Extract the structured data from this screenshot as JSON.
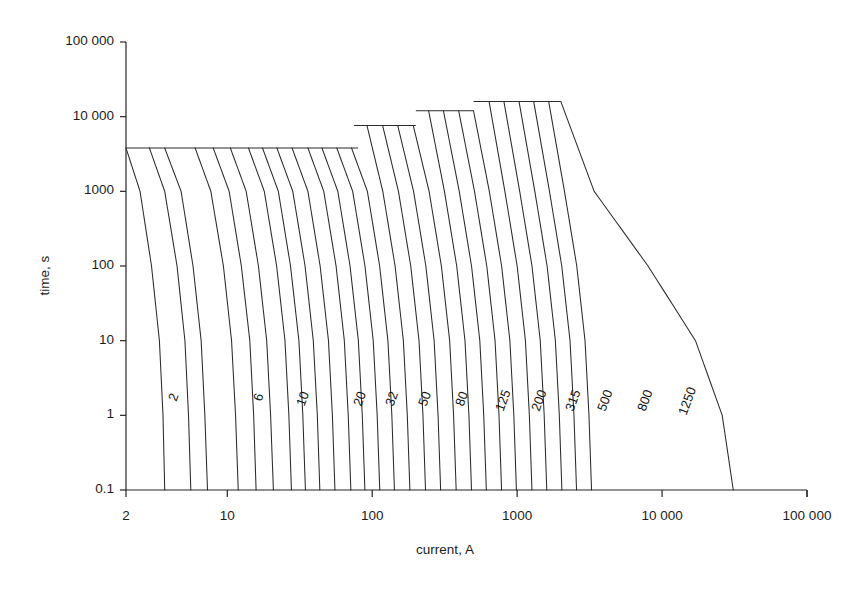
{
  "page": {
    "cut_off_caption": "",
    "background": "#ffffff",
    "ink": "#1a1a1a"
  },
  "chart_data": {
    "type": "line",
    "title": "",
    "xlabel": "current, A",
    "ylabel": "time, s",
    "xscale": "log",
    "yscale": "log",
    "xlim": [
      2,
      100000
    ],
    "ylim": [
      0.1,
      100000
    ],
    "grid": false,
    "legend": "none",
    "xticks": [
      2,
      10,
      100,
      1000,
      10000,
      100000
    ],
    "xtick_labels": [
      "2",
      "10",
      "100",
      "1000",
      "10 000",
      "100 000"
    ],
    "yticks": [
      0.1,
      1,
      10,
      100,
      1000,
      10000,
      100000
    ],
    "ytick_labels": [
      "0.1",
      "1",
      "10",
      "100",
      "1000",
      "10 000",
      "100 000"
    ],
    "labeled_series": [
      "2",
      "6",
      "10",
      "20",
      "32",
      "50",
      "80",
      "125",
      "200",
      "315",
      "500",
      "800",
      "1250"
    ],
    "plateaus": [
      {
        "time_s": 3800,
        "current_from": 2,
        "current_to": 80
      },
      {
        "time_s": 7600,
        "current_from": 75,
        "current_to": 200
      },
      {
        "time_s": 12000,
        "current_from": 200,
        "current_to": 500
      },
      {
        "time_s": 16000,
        "current_from": 500,
        "current_to": 2000
      }
    ],
    "series": [
      {
        "name": "2",
        "label": "2",
        "plateau_time": 3800,
        "x": [
          2,
          2.5,
          3.0,
          3.4,
          3.6,
          3.7
        ],
        "y": [
          3800,
          1000,
          100,
          10,
          1,
          0.1
        ]
      },
      {
        "name": "3",
        "label": "",
        "plateau_time": 3800,
        "x": [
          2.9,
          3.7,
          4.5,
          5.1,
          5.4,
          5.6
        ],
        "y": [
          3800,
          1000,
          100,
          10,
          1,
          0.1
        ]
      },
      {
        "name": "4",
        "label": "",
        "plateau_time": 3800,
        "x": [
          3.7,
          4.8,
          5.8,
          6.6,
          7.0,
          7.3
        ],
        "y": [
          3800,
          1000,
          100,
          10,
          1,
          0.1
        ]
      },
      {
        "name": "6",
        "label": "6",
        "plateau_time": 3800,
        "x": [
          6.0,
          7.7,
          9.4,
          10.7,
          11.4,
          11.9
        ],
        "y": [
          3800,
          1000,
          100,
          10,
          1,
          0.1
        ]
      },
      {
        "name": "8",
        "label": "",
        "plateau_time": 3800,
        "x": [
          8.0,
          10.3,
          12.5,
          14.3,
          15.2,
          15.8
        ],
        "y": [
          3800,
          1000,
          100,
          10,
          1,
          0.1
        ]
      },
      {
        "name": "10",
        "label": "10",
        "plateau_time": 3800,
        "x": [
          10.5,
          13.5,
          16.4,
          18.7,
          19.9,
          20.8
        ],
        "y": [
          3800,
          1000,
          100,
          10,
          1,
          0.1
        ]
      },
      {
        "name": "13",
        "label": "",
        "plateau_time": 3800,
        "x": [
          14.0,
          18.0,
          21.9,
          25.0,
          26.6,
          27.7
        ],
        "y": [
          3800,
          1000,
          100,
          10,
          1,
          0.1
        ]
      },
      {
        "name": "16",
        "label": "",
        "plateau_time": 3800,
        "x": [
          17.5,
          22.5,
          27.3,
          31.2,
          33.2,
          34.6
        ],
        "y": [
          3800,
          1000,
          100,
          10,
          1,
          0.1
        ]
      },
      {
        "name": "20",
        "label": "20",
        "plateau_time": 3800,
        "x": [
          22.0,
          28.3,
          34.4,
          39.2,
          41.8,
          43.5
        ],
        "y": [
          3800,
          1000,
          100,
          10,
          1,
          0.1
        ]
      },
      {
        "name": "25",
        "label": "",
        "plateau_time": 3800,
        "x": [
          28.0,
          36.0,
          43.7,
          49.9,
          53.1,
          55.3
        ],
        "y": [
          3800,
          1000,
          100,
          10,
          1,
          0.1
        ]
      },
      {
        "name": "32",
        "label": "32",
        "plateau_time": 3800,
        "x": [
          36.0,
          46.3,
          56.3,
          64.2,
          68.3,
          71.2
        ],
        "y": [
          3800,
          1000,
          100,
          10,
          1,
          0.1
        ]
      },
      {
        "name": "40",
        "label": "",
        "plateau_time": 3800,
        "x": [
          45.0,
          57.9,
          70.3,
          80.2,
          85.4,
          89.0
        ],
        "y": [
          3800,
          1000,
          100,
          10,
          1,
          0.1
        ]
      },
      {
        "name": "50",
        "label": "50",
        "plateau_time": 3800,
        "x": [
          57.0,
          73.3,
          89.1,
          101.6,
          108.2,
          112.7
        ],
        "y": [
          3800,
          1000,
          100,
          10,
          1,
          0.1
        ]
      },
      {
        "name": "63",
        "label": "",
        "plateau_time": 3800,
        "x": [
          72.0,
          92.6,
          112.5,
          128.3,
          136.6,
          142.3
        ],
        "y": [
          3800,
          1000,
          100,
          10,
          1,
          0.1
        ]
      },
      {
        "name": "80",
        "label": "80",
        "plateau_time": 7600,
        "x": [
          92.0,
          118.3,
          143.8,
          164.0,
          174.6,
          181.9
        ],
        "y": [
          7600,
          1000,
          100,
          10,
          1,
          0.1
        ]
      },
      {
        "name": "100",
        "label": "",
        "plateau_time": 7600,
        "x": [
          118.0,
          151.7,
          184.4,
          210.3,
          223.9,
          233.2
        ],
        "y": [
          7600,
          1000,
          100,
          10,
          1,
          0.1
        ]
      },
      {
        "name": "125",
        "label": "125",
        "plateau_time": 7600,
        "x": [
          150.0,
          192.9,
          234.4,
          267.4,
          284.6,
          296.5
        ],
        "y": [
          7600,
          1000,
          100,
          10,
          1,
          0.1
        ]
      },
      {
        "name": "160",
        "label": "",
        "plateau_time": 7600,
        "x": [
          192.0,
          246.9,
          300.0,
          342.2,
          364.3,
          379.5
        ],
        "y": [
          7600,
          1000,
          100,
          10,
          1,
          0.1
        ]
      },
      {
        "name": "200",
        "label": "200",
        "plateau_time": 12000,
        "x": [
          245.0,
          315.0,
          382.8,
          436.6,
          464.8,
          484.2
        ],
        "y": [
          12000,
          1000,
          100,
          10,
          1,
          0.1
        ]
      },
      {
        "name": "250",
        "label": "",
        "plateau_time": 12000,
        "x": [
          310.0,
          398.6,
          484.4,
          552.5,
          588.2,
          612.7
        ],
        "y": [
          12000,
          1000,
          100,
          10,
          1,
          0.1
        ]
      },
      {
        "name": "315",
        "label": "315",
        "plateau_time": 12000,
        "x": [
          395.0,
          507.9,
          617.2,
          703.9,
          749.4,
          780.7
        ],
        "y": [
          12000,
          1000,
          100,
          10,
          1,
          0.1
        ]
      },
      {
        "name": "400",
        "label": "",
        "plateau_time": 12000,
        "x": [
          500.0,
          642.9,
          781.3,
          891.0,
          948.6,
          988.2
        ],
        "y": [
          12000,
          1000,
          100,
          10,
          1,
          0.1
        ]
      },
      {
        "name": "500",
        "label": "500",
        "plateau_time": 16000,
        "x": [
          640.0,
          822.9,
          1000.0,
          1140.5,
          1214.2,
          1264.9
        ],
        "y": [
          16000,
          1000,
          100,
          10,
          1,
          0.1
        ]
      },
      {
        "name": "630",
        "label": "",
        "plateau_time": 16000,
        "x": [
          810.0,
          1041.4,
          1265.6,
          1443.4,
          1536.7,
          1600.8
        ],
        "y": [
          16000,
          1000,
          100,
          10,
          1,
          0.1
        ]
      },
      {
        "name": "800",
        "label": "800",
        "plateau_time": 16000,
        "x": [
          1030.0,
          1324.3,
          1609.4,
          1835.5,
          1954.1,
          2035.6
        ],
        "y": [
          16000,
          1000,
          100,
          10,
          1,
          0.1
        ]
      },
      {
        "name": "1000",
        "label": "",
        "plateau_time": 16000,
        "x": [
          1300.0,
          1671.4,
          2031.3,
          2316.4,
          2466.1,
          2569.0
        ],
        "y": [
          16000,
          1000,
          100,
          10,
          1,
          0.1
        ]
      },
      {
        "name": "1250",
        "label": "1250",
        "plateau_time": 16000,
        "x": [
          1650.0,
          2121.4,
          2578.1,
          2939.9,
          3129.9,
          3260.4
        ],
        "y": [
          16000,
          1000,
          100,
          10,
          1,
          0.1
        ]
      },
      {
        "name": "1600",
        "label": "",
        "plateau_time": 16000,
        "x": [
          2000.0,
          3400.0,
          8000.0,
          17000.0,
          26000.0,
          31000.0
        ],
        "y": [
          16000,
          1000,
          100,
          10,
          1,
          0.1
        ]
      }
    ],
    "curve_labels": [
      {
        "text": "2",
        "x_px": 165,
        "y_px": 398
      },
      {
        "text": "6",
        "x_px": 250,
        "y_px": 398
      },
      {
        "text": "10",
        "x_px": 293,
        "y_px": 403
      },
      {
        "text": "20",
        "x_px": 350,
        "y_px": 403
      },
      {
        "text": "32",
        "x_px": 382,
        "y_px": 403
      },
      {
        "text": "50",
        "x_px": 415,
        "y_px": 403
      },
      {
        "text": "80",
        "x_px": 452,
        "y_px": 403
      },
      {
        "text": "125",
        "x_px": 492,
        "y_px": 408
      },
      {
        "text": "200",
        "x_px": 528,
        "y_px": 408
      },
      {
        "text": "315",
        "x_px": 562,
        "y_px": 408
      },
      {
        "text": "500",
        "x_px": 594,
        "y_px": 408
      },
      {
        "text": "800",
        "x_px": 634,
        "y_px": 408
      },
      {
        "text": "1250",
        "x_px": 675,
        "y_px": 412
      }
    ]
  },
  "axes": {
    "y_title": "time, s",
    "x_title": "current, A"
  }
}
